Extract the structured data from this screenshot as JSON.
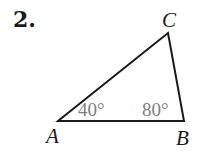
{
  "problem": {
    "number": "2."
  },
  "triangle": {
    "vertices": [
      {
        "name": "A",
        "label": "A"
      },
      {
        "name": "B",
        "label": "B"
      },
      {
        "name": "C",
        "label": "C"
      }
    ],
    "angles": [
      {
        "vertex": "A",
        "label": "40°"
      },
      {
        "vertex": "B",
        "label": "80°"
      }
    ],
    "stroke_color": "#1a1a1a",
    "angle_label_color": "#808080"
  }
}
